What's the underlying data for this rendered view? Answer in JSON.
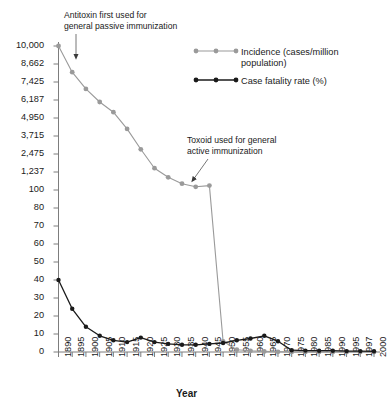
{
  "chart_data": {
    "type": "line",
    "title": "",
    "xlabel": "Year",
    "ylabel": "",
    "grid": false,
    "legend_position": "top-right",
    "x": [
      1890,
      1895,
      1900,
      1905,
      1910,
      1915,
      1920,
      1925,
      1930,
      1935,
      1940,
      1945,
      1950,
      1955,
      1960,
      1965,
      1970,
      1975,
      1980,
      1985,
      1990,
      1995,
      1997,
      2000
    ],
    "axis_note": "broken y-axis: upper segment 100-10,000 (incidence), lower segment 0-80 (case fatality rate)",
    "y_ticks_upper": [
      "10,000",
      "8,662",
      "7,425",
      "6,187",
      "4,950",
      "3,715",
      "2,475",
      "1,237",
      "100"
    ],
    "y_ticks_lower": [
      "80",
      "70",
      "60",
      "50",
      "40",
      "30",
      "20",
      "10",
      "0"
    ],
    "ylim_upper": [
      100,
      10000
    ],
    "ylim_lower": [
      0,
      80
    ],
    "series": [
      {
        "name": "Incidence (cases/million population)",
        "color": "#9a9a9a",
        "unit": "cases/million population",
        "values": [
          10000,
          8100,
          6950,
          6050,
          5350,
          4200,
          2800,
          1500,
          900,
          500,
          300,
          380,
          55,
          12,
          6,
          3,
          1,
          0.6,
          0.4,
          0.3,
          0.25,
          0.2,
          0.2,
          0.15
        ]
      },
      {
        "name": "Case fatality rate (%)",
        "color": "#1a1a1a",
        "unit": "%",
        "values": [
          40,
          24,
          14,
          9,
          6.5,
          5.5,
          8,
          5.5,
          4.5,
          4,
          4,
          4.5,
          5,
          6.5,
          7.5,
          9,
          6,
          1,
          0.8,
          0.7,
          0.7,
          0.5,
          0.5,
          0.4
        ]
      }
    ],
    "annotations": [
      {
        "text": "Antitoxin first used for\ngeneral passive immunization",
        "points_to_year": 1895
      },
      {
        "text": "Toxoid used for general\nactive immunization",
        "points_to_year": 1945
      }
    ]
  },
  "annotation1": {
    "line1": "Antitoxin first used for",
    "line2": "general passive immunization"
  },
  "annotation2": {
    "line1": "Toxoid used for general",
    "line2": "active immunization"
  },
  "legend": {
    "incidence_line1": "Incidence (cases/million",
    "incidence_line2": "population)",
    "fatality": "Case fatality rate (%)"
  },
  "axes": {
    "x_title": "Year",
    "y_labels": [
      "10,000",
      "8,662",
      "7,425",
      "6,187",
      "4,950",
      "3,715",
      "2,475",
      "1,237",
      "100",
      "80",
      "70",
      "60",
      "50",
      "40",
      "30",
      "20",
      "10",
      "0"
    ],
    "x_labels": [
      "1890",
      "1895",
      "1900",
      "1905",
      "1910",
      "1915",
      "1920",
      "1925",
      "1930",
      "1935",
      "1940",
      "1945",
      "1950",
      "1955",
      "1960",
      "1965",
      "1970",
      "1975",
      "1980",
      "1985",
      "1990",
      "1995",
      "1997",
      "2000"
    ]
  },
  "colors": {
    "incidence": "#9a9a9a",
    "fatality": "#1a1a1a",
    "axis": "#7d7d7d",
    "text": "#1a1a1a"
  }
}
